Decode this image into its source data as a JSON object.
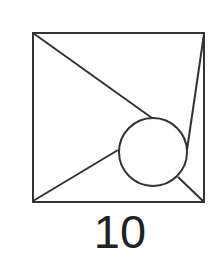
{
  "figure": {
    "label": "10",
    "stroke_color": "#333333",
    "square": {
      "x1": 33,
      "y1": 33,
      "x2": 204,
      "y2": 202
    },
    "circle": {
      "cx": 153,
      "cy": 152,
      "r": 34
    },
    "lines": [
      {
        "name": "top-left-to-circle",
        "x1": 33,
        "y1": 33,
        "x2": 152,
        "y2": 118
      },
      {
        "name": "bottom-left-to-circle",
        "x1": 33,
        "y1": 201,
        "x2": 118,
        "y2": 150
      },
      {
        "name": "top-right-to-circle",
        "x1": 204,
        "y1": 34,
        "x2": 187,
        "y2": 150
      },
      {
        "name": "bottom-right-to-circle",
        "x1": 204,
        "y1": 202,
        "x2": 178,
        "y2": 177
      }
    ]
  }
}
